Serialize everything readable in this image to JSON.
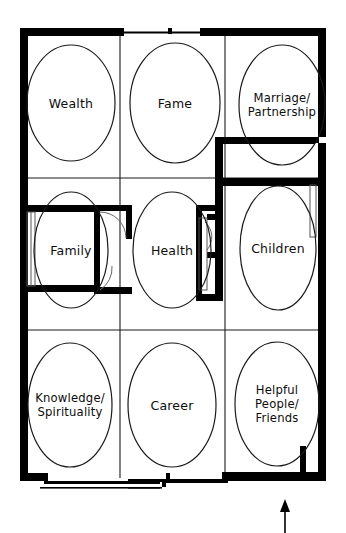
{
  "diagram": {
    "type": "feng-shui-bagua-floorplan",
    "grid": {
      "rows": 3,
      "cols": 3
    },
    "stroke_color": "#000000",
    "wall_color": "#000000",
    "background_color": "#ffffff",
    "ellipse_stroke": "#1a1a1a"
  },
  "cells": [
    {
      "id": "wealth",
      "label": "Wealth",
      "row": 1,
      "col": 1,
      "cx": 71,
      "cy": 103,
      "rx": 44,
      "ry": 58
    },
    {
      "id": "fame",
      "label": "Fame",
      "row": 1,
      "col": 2,
      "cx": 175,
      "cy": 103,
      "rx": 45,
      "ry": 60
    },
    {
      "id": "marriage-partnership",
      "label": "Marriage/\nPartnership",
      "row": 1,
      "col": 3,
      "cx": 282,
      "cy": 105,
      "rx": 43,
      "ry": 60
    },
    {
      "id": "family",
      "label": "Family",
      "row": 2,
      "col": 1,
      "cx": 71,
      "cy": 250,
      "rx": 37,
      "ry": 58
    },
    {
      "id": "health",
      "label": "Health",
      "row": 2,
      "col": 2,
      "cx": 172,
      "cy": 250,
      "rx": 39,
      "ry": 58
    },
    {
      "id": "children",
      "label": "Children",
      "row": 2,
      "col": 3,
      "cx": 278,
      "cy": 248,
      "rx": 38,
      "ry": 62
    },
    {
      "id": "knowledge-spirituality",
      "label": "Knowledge/\nSpirituality",
      "row": 3,
      "col": 1,
      "cx": 70,
      "cy": 405,
      "rx": 42,
      "ry": 62
    },
    {
      "id": "career",
      "label": "Career",
      "row": 3,
      "col": 2,
      "cx": 172,
      "cy": 405,
      "rx": 44,
      "ry": 62
    },
    {
      "id": "helpful-people-friends",
      "label": "Helpful\nPeople/\nFriends",
      "row": 3,
      "col": 3,
      "cx": 277,
      "cy": 404,
      "rx": 42,
      "ry": 62
    }
  ],
  "annotations": {
    "entrance_arrow": {
      "name": "entrance-direction-arrow",
      "direction": "up",
      "x": 285,
      "y_top": 500,
      "y_bottom": 533
    }
  }
}
